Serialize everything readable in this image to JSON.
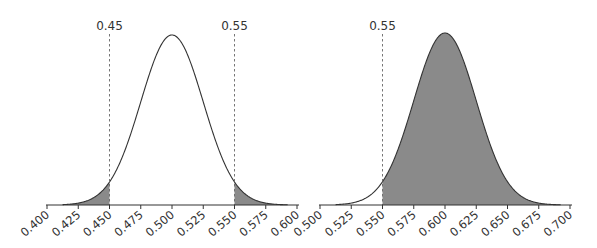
{
  "chart_data": [
    {
      "type": "area",
      "title": "",
      "description": "Normal distribution centered at 0.500 with both tails beyond 0.45 and 0.55 shaded",
      "distribution": {
        "mean": 0.5,
        "sd": 0.025
      },
      "xlabel": "",
      "ylabel": "",
      "xlim": [
        0.4,
        0.6
      ],
      "x_ticks": [
        "0.400",
        "0.425",
        "0.450",
        "0.475",
        "0.500",
        "0.525",
        "0.550",
        "0.575",
        "0.600"
      ],
      "reference_lines": [
        {
          "x": 0.45,
          "label": "0.45",
          "style": "dashed"
        },
        {
          "x": 0.55,
          "label": "0.55",
          "style": "dashed"
        }
      ],
      "shaded_regions": [
        {
          "from": 0.4,
          "to": 0.45
        },
        {
          "from": 0.55,
          "to": 0.6
        }
      ],
      "fill_color": "#8a8a8a",
      "curve_fill": "#ffffff",
      "grid": false
    },
    {
      "type": "area",
      "title": "",
      "description": "Normal distribution centered at 0.600 with region above 0.55 shaded",
      "distribution": {
        "mean": 0.6,
        "sd": 0.025
      },
      "xlabel": "",
      "ylabel": "",
      "xlim": [
        0.5,
        0.7
      ],
      "x_ticks": [
        "0.500",
        "0.525",
        "0.550",
        "0.575",
        "0.600",
        "0.625",
        "0.650",
        "0.675",
        "0.700"
      ],
      "reference_lines": [
        {
          "x": 0.55,
          "label": "0.55",
          "style": "dashed"
        }
      ],
      "shaded_regions": [
        {
          "from": 0.55,
          "to": 0.7
        }
      ],
      "fill_color": "#8a8a8a",
      "curve_fill": "#ffffff",
      "grid": false
    }
  ],
  "layout": {
    "charts": [
      {
        "x0px": 47,
        "x1px": 297,
        "axis_y": 205,
        "peak_y": 35
      },
      {
        "x0px": 320,
        "x1px": 570,
        "axis_y": 205,
        "peak_y": 33
      }
    ]
  }
}
